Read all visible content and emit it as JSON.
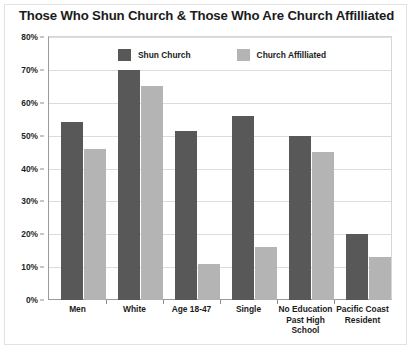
{
  "chart_data": {
    "type": "bar",
    "title": "Those Who Shun Church & Those Who Are Church Affilliated",
    "xlabel": "",
    "ylabel": "",
    "ylim": [
      0,
      80
    ],
    "ytick_labels": [
      "0%",
      "10%",
      "20%",
      "30%",
      "40%",
      "50%",
      "60%",
      "70%",
      "80%"
    ],
    "ytick_values": [
      0,
      10,
      20,
      30,
      40,
      50,
      60,
      70,
      80
    ],
    "grid": true,
    "legend_position": "top-center",
    "categories": [
      "Men",
      "White",
      "Age 18-47",
      "Single",
      "No Education Past High School",
      "Pacific Coast Resident"
    ],
    "category_lines": [
      [
        "Men"
      ],
      [
        "White"
      ],
      [
        "Age 18-47"
      ],
      [
        "Single"
      ],
      [
        "No Education",
        "Past High",
        "School"
      ],
      [
        "Pacific Coast",
        "Resident"
      ]
    ],
    "series": [
      {
        "name": "Shun Church",
        "color": "#585858",
        "values": [
          54,
          70,
          51.5,
          56,
          50,
          20
        ]
      },
      {
        "name": "Church Affilliated",
        "color": "#b4b4b4",
        "values": [
          46,
          65,
          11,
          16,
          45,
          13
        ]
      }
    ]
  },
  "colors": {
    "series_dark": "#585858",
    "series_light": "#b4b4b4",
    "axis": "#9a9a9a",
    "grid": "#dcdcdc",
    "text": "#1b1b1b",
    "background": "#ffffff"
  }
}
